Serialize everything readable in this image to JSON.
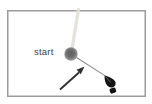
{
  "canvas": {
    "start_label": "start"
  },
  "colors": {
    "background": "#ffffff",
    "canvas_border": "#9b9b9b",
    "faint_trail": "#e3e1db",
    "start_node_dark": "#5e5e5e",
    "start_node_light": "#a7a7a7",
    "stroke_line": "#8d8d8d",
    "arrow": "#2e2e2e",
    "pen_cursor": "#141414",
    "label_text": "#3f3f3f"
  },
  "icons": {
    "pen": "pen-cursor-icon",
    "arrow": "annotation-arrow-icon",
    "node": "start-node-dot"
  }
}
